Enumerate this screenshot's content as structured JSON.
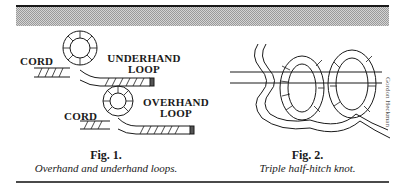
{
  "figures": [
    {
      "title": "Fig. 1.",
      "caption": "Overhand and underhand loops.",
      "labels": {
        "cord_top": "CORD",
        "underhand_line1": "UNDERHAND",
        "underhand_line2": "LOOP",
        "cord_bottom": "CORD",
        "overhand_line1": "OVERHAND",
        "overhand_line2": "LOOP"
      }
    },
    {
      "title": "Fig. 2.",
      "caption": "Triple half-hitch knot.",
      "credit": "Gordon Heckman"
    }
  ],
  "colors": {
    "ink": "#1a1a1a",
    "band": "#bdbdbd"
  }
}
